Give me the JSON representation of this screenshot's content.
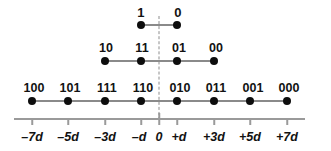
{
  "figure": {
    "background_color": "#ffffff",
    "dot_color": "#0d0d0d",
    "line_color": "#8a8a8a",
    "axis_color": "#9a9a9a",
    "text_color": "#121212"
  },
  "axis": {
    "name": "amplitude-axis",
    "tick_labels": [
      "–7d",
      "–5d",
      "–3d",
      "–d",
      "0",
      "+d",
      "+3d",
      "+5d",
      "+7d"
    ],
    "tick_values": [
      -7,
      -5,
      -3,
      -1,
      0,
      1,
      3,
      5,
      7
    ],
    "zero_label": "0",
    "center_dashed_line": true
  },
  "rows": [
    {
      "name": "row-1-bit",
      "bits": 1,
      "labels": [
        "1",
        "0"
      ],
      "positions": [
        -1,
        1
      ]
    },
    {
      "name": "row-2-bit",
      "bits": 2,
      "labels": [
        "10",
        "11",
        "01",
        "00"
      ],
      "positions": [
        -3,
        -1,
        1,
        3
      ]
    },
    {
      "name": "row-3-bit",
      "bits": 3,
      "labels": [
        "100",
        "101",
        "111",
        "110",
        "010",
        "011",
        "001",
        "000"
      ],
      "positions": [
        -7,
        -5,
        -3,
        -1,
        1,
        3,
        5,
        7
      ]
    }
  ]
}
